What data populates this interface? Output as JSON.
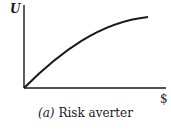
{
  "figure": {
    "y_axis_label": "U",
    "x_axis_label": "$",
    "caption_label": "(a)",
    "caption_text": "Risk averter"
  },
  "colors": {
    "line": "#1a1a1a",
    "background": "#ffffff"
  }
}
